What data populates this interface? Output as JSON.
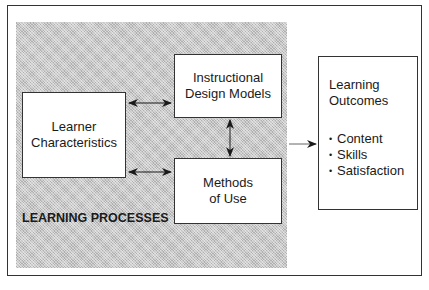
{
  "diagram": {
    "region_label": "LEARNING PROCESSES",
    "boxes": {
      "learner": {
        "lines": [
          "Learner",
          "Characteristics"
        ]
      },
      "instructional_design": {
        "lines": [
          "Instructional",
          "Design Models"
        ]
      },
      "methods": {
        "lines": [
          "Methods",
          "of Use"
        ]
      },
      "outcomes": {
        "title_lines": [
          "Learning",
          "Outcomes"
        ],
        "items": [
          "Content",
          "Skills",
          "Satisfaction"
        ]
      }
    },
    "connections": [
      {
        "from": "learner",
        "to": "instructional_design",
        "type": "bidirectional"
      },
      {
        "from": "learner",
        "to": "methods",
        "type": "bidirectional"
      },
      {
        "from": "instructional_design",
        "to": "methods",
        "type": "bidirectional"
      },
      {
        "from": "learning_processes",
        "to": "outcomes",
        "type": "directed"
      }
    ],
    "colors": {
      "frame": "#333333",
      "shading": "#c8c8c8",
      "box_fill": "#ffffff",
      "text": "#1a1a1a"
    }
  }
}
